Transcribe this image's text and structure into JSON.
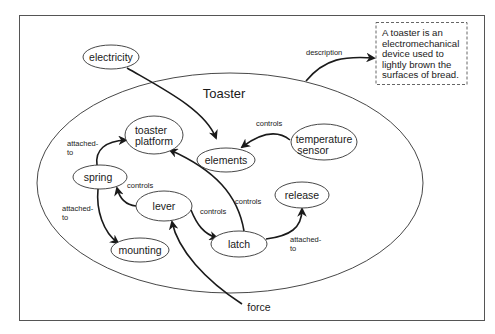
{
  "diagram": {
    "type": "concept-map",
    "container": {
      "label": "Toaster"
    },
    "description": {
      "lines": [
        "A toaster is an",
        "electromechanical",
        "device used to",
        "lightly brown the",
        "surfaces of bread."
      ]
    },
    "nodes": {
      "electricity": "electricity",
      "toaster_platform": [
        "toaster",
        "platform"
      ],
      "elements": "elements",
      "temperature_sensor": [
        "temperature",
        "sensor"
      ],
      "spring": "spring",
      "lever": "lever",
      "release": "release",
      "latch": "latch",
      "mounting": "mounting",
      "force": "force"
    },
    "edges": [
      {
        "from": "Toaster",
        "to": "description",
        "label": "description"
      },
      {
        "from": "electricity",
        "to": "elements",
        "label": ""
      },
      {
        "from": "temperature sensor",
        "to": "elements",
        "label": "controls"
      },
      {
        "from": "spring",
        "to": "toaster platform",
        "label": "attached-to"
      },
      {
        "from": "spring",
        "to": "mounting",
        "label": "attached-to"
      },
      {
        "from": "lever",
        "to": "spring",
        "label": "controls"
      },
      {
        "from": "lever",
        "to": "latch",
        "label": "controls"
      },
      {
        "from": "latch",
        "to": "toaster platform",
        "label": "controls"
      },
      {
        "from": "latch",
        "to": "release",
        "label": "attached-to"
      },
      {
        "from": "force",
        "to": "lever",
        "label": ""
      }
    ],
    "labels": {
      "description": "description",
      "controls": "controls",
      "attached": "attached-",
      "to": "to"
    },
    "colors": {
      "stroke": "#1a1a1a",
      "frame": "#555555",
      "background": "#ffffff"
    }
  }
}
